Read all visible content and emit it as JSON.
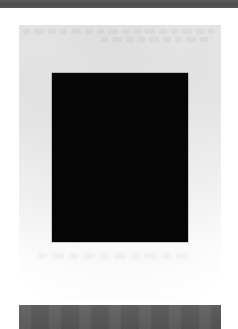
{
  "document": {
    "title": "Scanned page preview",
    "background_color": "#ffffff"
  },
  "top_bar": {
    "name": "top-rule",
    "color": "#555555",
    "height_px": 8,
    "full_width": true
  },
  "page_panel": {
    "name": "scanned-page",
    "background_color": "#ececec",
    "bottom_color": "#ffffff",
    "left_px": 19,
    "top_px": 25,
    "width_px": 202,
    "height_px": 275,
    "header_text": "",
    "footer_text": "",
    "text_legible": false,
    "text_note": "faint illegible blurred text"
  },
  "black_plate": {
    "name": "black-image-plate",
    "color": "#050505",
    "left_px": 52,
    "top_px": 73,
    "width_px": 136,
    "height_px": 169
  },
  "bottom_bar": {
    "name": "bottom-rule",
    "color": "#595959",
    "left_px": 19,
    "top_px": 305,
    "width_px": 202,
    "height_px": 24
  }
}
